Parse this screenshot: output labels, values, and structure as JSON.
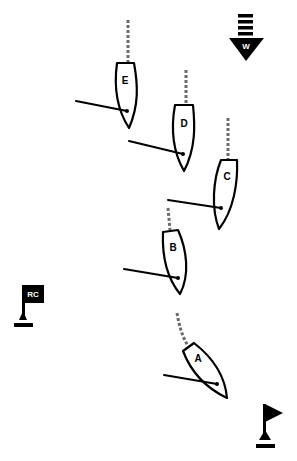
{
  "diagram": {
    "type": "sailing-start-line",
    "background": "#ffffff",
    "ink_color": "#000000",
    "track_color": "#6b6b6b"
  },
  "wind": {
    "label": "W",
    "direction": "down",
    "icon": "wind-arrow-icon"
  },
  "marks": {
    "committee_boat": {
      "label": "RC",
      "icon": "rc-flag-icon"
    },
    "pin_end": {
      "label": "",
      "icon": "pin-flag-icon"
    }
  },
  "boats": [
    {
      "label": "A"
    },
    {
      "label": "B"
    },
    {
      "label": "C"
    },
    {
      "label": "D"
    },
    {
      "label": "E"
    }
  ]
}
